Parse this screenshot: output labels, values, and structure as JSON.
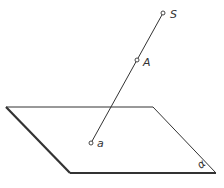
{
  "diagram": {
    "type": "geometry-projection",
    "plane": {
      "label": "α",
      "corners": [
        [
          6,
          107
        ],
        [
          153,
          107
        ],
        [
          216,
          173
        ],
        [
          70,
          173
        ]
      ]
    },
    "line": {
      "from": [
        163,
        13
      ],
      "to": [
        91,
        143
      ]
    },
    "points": [
      {
        "id": "S",
        "label": "S",
        "x": 163,
        "y": 13,
        "lx": 170,
        "ly": 18
      },
      {
        "id": "A",
        "label": "A",
        "x": 137,
        "y": 60,
        "lx": 143,
        "ly": 66
      },
      {
        "id": "a",
        "label": "a",
        "x": 91,
        "y": 143,
        "lx": 97,
        "ly": 147
      }
    ],
    "colors": {
      "stroke": "#333333",
      "background": "#ffffff"
    }
  }
}
